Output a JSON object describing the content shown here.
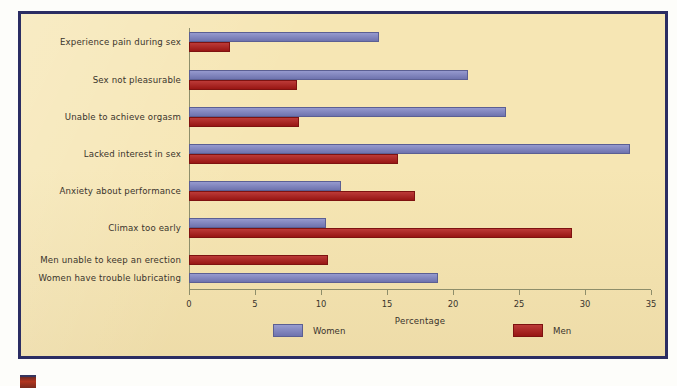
{
  "chart_data": {
    "type": "bar",
    "orientation": "horizontal",
    "title": "",
    "xlabel": "Percentage",
    "ylabel": "",
    "xlim": [
      0,
      35
    ],
    "xticks": [
      0,
      5,
      10,
      15,
      20,
      25,
      30,
      35
    ],
    "xtick_labels": [
      "0",
      "5",
      "10",
      "15",
      "20",
      "25",
      "30",
      "35"
    ],
    "grid": false,
    "legend_position": "bottom",
    "categories": [
      "Experience pain during sex",
      "Sex not pleasurable",
      "Unable to achieve orgasm",
      "Lacked interest in sex",
      "Anxiety about performance",
      "Climax too early",
      "Men unable to keep an erection",
      "Women have trouble lubricating"
    ],
    "series": [
      {
        "name": "Women",
        "color": "#7b80c2",
        "values": [
          14.4,
          21.1,
          24.0,
          33.4,
          11.5,
          10.4,
          null,
          18.9
        ]
      },
      {
        "name": "Men",
        "color": "#b11a17",
        "values": [
          3.1,
          8.2,
          8.3,
          15.8,
          17.1,
          29.0,
          10.5,
          null
        ]
      }
    ]
  },
  "legend": {
    "items": [
      {
        "label": "Women",
        "swatch": "women-swatch",
        "color": "#7b80c2"
      },
      {
        "label": "Men",
        "swatch": "men-swatch",
        "color": "#b11a17"
      }
    ]
  },
  "style": {
    "background": "#f6e6b4",
    "frame_border": "#2b2d63",
    "axis_color": "#8e8e6a",
    "text_color": "#3a342c",
    "page_background": "#ffffff"
  }
}
